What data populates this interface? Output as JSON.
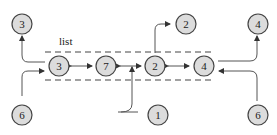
{
  "diagram": {
    "title_label": "list",
    "list_nodes": [
      {
        "id": "l3",
        "label": "3"
      },
      {
        "id": "l7",
        "label": "7"
      },
      {
        "id": "l2",
        "label": "2"
      },
      {
        "id": "l4",
        "label": "4"
      }
    ],
    "outer_nodes": [
      {
        "id": "top3",
        "label": "3"
      },
      {
        "id": "bot6a",
        "label": "6"
      },
      {
        "id": "bot1",
        "label": "1"
      },
      {
        "id": "top2",
        "label": "2"
      },
      {
        "id": "top4",
        "label": "4"
      },
      {
        "id": "bot6b",
        "label": "6"
      }
    ],
    "colors": {
      "node_fill": "#dcdcdc",
      "stroke": "#444444"
    }
  }
}
